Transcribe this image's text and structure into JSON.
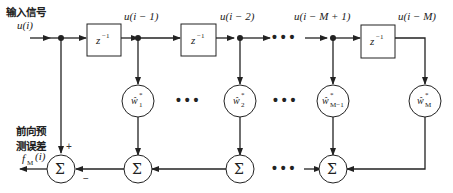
{
  "diagram": {
    "input_label_cn": "输入信号",
    "input_signal": "u(i)",
    "output_label_cn_line1": "前向预",
    "output_label_cn_line2": "测误差",
    "output_signal": "f",
    "output_signal_sub": "M",
    "output_signal_arg": "(i)",
    "delay_label": "z",
    "delay_exp": "−1",
    "tap_labels": [
      "u(i − 1)",
      "u(i − 2)",
      "u(i − M + 1)",
      "u(i − M)"
    ],
    "weights": [
      {
        "base": "ŵ",
        "sub": "1",
        "sup": "*"
      },
      {
        "base": "ŵ",
        "sub": "2",
        "sup": "*"
      },
      {
        "base": "ŵ",
        "sub": "M−1",
        "sup": "*"
      },
      {
        "base": "ŵ",
        "sub": "M",
        "sup": "*"
      }
    ],
    "sum_symbol": "Σ",
    "plus_sign": "+",
    "minus_sign": "−",
    "ellipsis": "• • •"
  }
}
